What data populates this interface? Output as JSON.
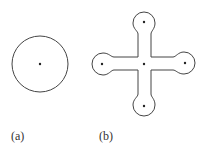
{
  "figure": {
    "panels": [
      {
        "id": "a",
        "label": "(a)",
        "shape": "circle",
        "center": [
          40,
          64
        ],
        "radius": 28,
        "points": [
          [
            40,
            64
          ]
        ]
      },
      {
        "id": "b",
        "label": "(b)",
        "shape": "cross-with-rounded-lobes",
        "center": [
          144,
          64
        ],
        "points": [
          [
            144,
            64
          ],
          [
            144,
            22
          ],
          [
            102,
            64
          ],
          [
            185,
            63
          ],
          [
            144,
            106
          ]
        ]
      }
    ],
    "colors": {
      "stroke": "#444444",
      "dot": "#222222",
      "label": "#333333",
      "background": "#ffffff"
    }
  }
}
